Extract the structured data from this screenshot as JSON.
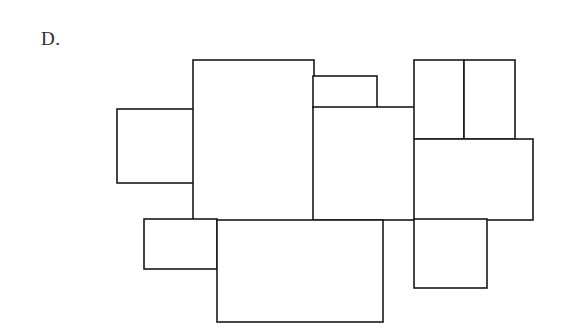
{
  "figure": {
    "label": "D.",
    "background_color": "#ffffff",
    "stroke_color": "#1a1a1a",
    "fill_color": "#ffffff",
    "stroke_width": 1.6,
    "canvas": {
      "width": 583,
      "height": 336
    },
    "rectangles": [
      {
        "name": "left-small-rect",
        "x": 117,
        "y": 109,
        "w": 77,
        "h": 74
      },
      {
        "name": "tall-center-rect",
        "x": 193,
        "y": 60,
        "w": 121,
        "h": 161
      },
      {
        "name": "top-thin-rect",
        "x": 313,
        "y": 76,
        "w": 64,
        "h": 32
      },
      {
        "name": "middle-right-rect",
        "x": 313,
        "y": 107,
        "w": 102,
        "h": 113
      },
      {
        "name": "top-right-left-rect",
        "x": 414,
        "y": 60,
        "w": 50,
        "h": 79
      },
      {
        "name": "top-right-right-rect",
        "x": 464,
        "y": 60,
        "w": 51,
        "h": 79
      },
      {
        "name": "right-wide-rect",
        "x": 414,
        "y": 139,
        "w": 119,
        "h": 81
      },
      {
        "name": "bottom-right-rect",
        "x": 414,
        "y": 219,
        "w": 73,
        "h": 69
      },
      {
        "name": "bottom-left-small-rect",
        "x": 144,
        "y": 219,
        "w": 73,
        "h": 50
      },
      {
        "name": "bottom-large-rect",
        "x": 217,
        "y": 220,
        "w": 166,
        "h": 102
      }
    ]
  }
}
